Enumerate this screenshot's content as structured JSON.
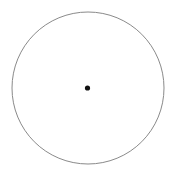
{
  "figure": {
    "kind": "geometry-diagram",
    "canvas": {
      "width": 176,
      "height": 177,
      "background_color": "#ffffff"
    },
    "shapes": {
      "circle": {
        "name": "circle-outline",
        "center_x": 88,
        "center_y": 88,
        "radius": 76,
        "stroke_color": "#8a8a8a",
        "stroke_width": 1,
        "fill": "none"
      },
      "center_point": {
        "name": "center-dot",
        "center_x": 87.5,
        "center_y": 88,
        "radius": 2.6,
        "fill_color": "#111111"
      }
    },
    "labels": []
  }
}
